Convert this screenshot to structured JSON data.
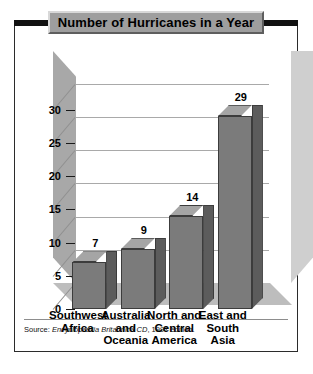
{
  "chart_data": {
    "type": "bar",
    "title": "Number of Hurricanes in a Year",
    "categories": [
      "Southwest Africa",
      "Australia and Oceania",
      "North and Central America",
      "East and South Asia"
    ],
    "category_lines": [
      [
        "Southwest",
        "Africa"
      ],
      [
        "Australia",
        "and",
        "Oceania"
      ],
      [
        "North and",
        "Central",
        "America"
      ],
      [
        "East and",
        "South Asia"
      ]
    ],
    "values": [
      7,
      9,
      14,
      29
    ],
    "value_labels": [
      "7",
      "9",
      "14",
      "29"
    ],
    "xlabel": "",
    "ylabel": "",
    "ylim": [
      0,
      31
    ],
    "yticks": [
      0,
      5,
      10,
      15,
      20,
      25,
      30
    ],
    "ytick_labels": [
      "0",
      "5",
      "10",
      "15",
      "20",
      "25",
      "30"
    ],
    "grid": true,
    "legend": false,
    "style": "3d-column",
    "colors": {
      "bar_front": "#7b7b7b",
      "bar_top": "#a5a5a5",
      "bar_side": "#5c5c5c",
      "back_wall": "#dedede",
      "left_wall": "#a8a8a8",
      "floor": "#bdbdbd",
      "title_banner": "#9e9e9e",
      "frame": "#2b2b2b"
    }
  },
  "source": {
    "lead": "Source: ",
    "work": "Encyclopædia Britannica CD",
    "rest": ", 1997 edition."
  }
}
